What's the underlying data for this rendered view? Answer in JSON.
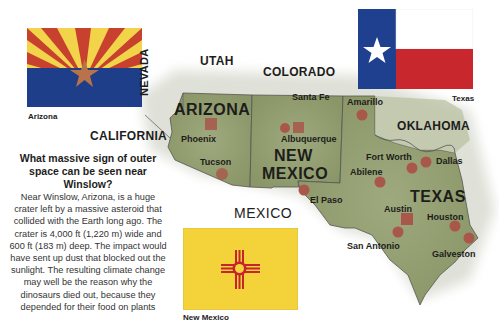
{
  "flags": {
    "arizona": {
      "caption": "Arizona",
      "colors": {
        "rays_red": "#c8402e",
        "rays_yellow": "#f2d44a",
        "bottom_blue": "#1f3e8a",
        "star_copper": "#b8734a"
      }
    },
    "texas": {
      "caption": "Texas",
      "colors": {
        "blue": "#1f3f8f",
        "white": "#ffffff",
        "red": "#c8282d",
        "star": "#ffffff"
      }
    },
    "new_mexico": {
      "caption": "New Mexico",
      "colors": {
        "field": "#f3d23a",
        "zia": "#c8242b"
      }
    }
  },
  "map": {
    "colors": {
      "land": "#9aa57a",
      "land_dark": "#7f8c62",
      "border": "#555",
      "city_dot": "#a8574a"
    },
    "states": {
      "utah": "UTAH",
      "colorado": "COLORADO",
      "nevada": "NEVADA",
      "california": "CALIFORNIA",
      "arizona": "ARIZONA",
      "new_mexico_line1": "NEW",
      "new_mexico_line2": "MEXICO",
      "oklahoma": "OKLAHOMA",
      "texas": "TEXAS",
      "mexico": "MEXICO"
    },
    "cities": [
      {
        "name": "Santa Fe",
        "capital": true
      },
      {
        "name": "Phoenix",
        "capital": true
      },
      {
        "name": "Albuquerque",
        "capital": false
      },
      {
        "name": "Tucson",
        "capital": false
      },
      {
        "name": "Amarillo",
        "capital": false
      },
      {
        "name": "El Paso",
        "capital": false
      },
      {
        "name": "Fort Worth",
        "capital": false
      },
      {
        "name": "Dallas",
        "capital": false
      },
      {
        "name": "Abilene",
        "capital": false
      },
      {
        "name": "Austin",
        "capital": true
      },
      {
        "name": "Houston",
        "capital": false
      },
      {
        "name": "San Antonio",
        "capital": false
      },
      {
        "name": "Galveston",
        "capital": false
      }
    ]
  },
  "sidebar": {
    "question": "What massive sign of outer space can be seen near Winslow?",
    "answer": "Near Winslow, Arizona, is a huge crater left by a massive asteroid that collided with the Earth long ago. The crater is 4,000 ft (1,220 m) wide and 600 ft (183 m) deep. The impact would have sent up dust that blocked out the sunlight. The resulting climate change may well be the reason why the dinosaurs died out, because they depended for their food on plants"
  }
}
